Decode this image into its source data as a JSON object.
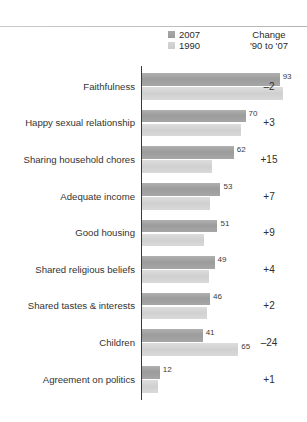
{
  "legend": {
    "series": [
      {
        "label": "2007",
        "color": "#9c9c9c",
        "swatch_icon": "square-swatch-icon"
      },
      {
        "label": "1990",
        "color": "#d4d4d4",
        "swatch_icon": "square-swatch-icon"
      }
    ]
  },
  "change_column": {
    "header_line1": "Change",
    "header_line2": "'90 to '07"
  },
  "chart_data": {
    "type": "bar",
    "orientation": "horizontal",
    "title": "",
    "subtitle": "",
    "xlabel": "",
    "ylabel": "",
    "xlim": [
      0,
      100
    ],
    "grid": false,
    "legend_position": "top-right",
    "categories": [
      "Faithfulness",
      "Happy sexual relationship",
      "Sharing household chores",
      "Adequate income",
      "Good housing",
      "Shared religious beliefs",
      "Shared tastes & interests",
      "Children",
      "Agreement on politics"
    ],
    "series": [
      {
        "name": "2007",
        "values": [
          93,
          70,
          62,
          53,
          51,
          49,
          46,
          41,
          12
        ],
        "labels": [
          "93",
          "70",
          "62",
          "53",
          "51",
          "49",
          "46",
          "41",
          "12"
        ]
      },
      {
        "name": "1990",
        "values": [
          95,
          67,
          47,
          46,
          42,
          45,
          44,
          65,
          11
        ],
        "labels": [
          "",
          "",
          "",
          "",
          "",
          "",
          "",
          "65",
          ""
        ]
      }
    ],
    "change": [
      "–2",
      "+3",
      "+15",
      "+7",
      "+9",
      "+4",
      "+2",
      "–24",
      "+1"
    ]
  }
}
